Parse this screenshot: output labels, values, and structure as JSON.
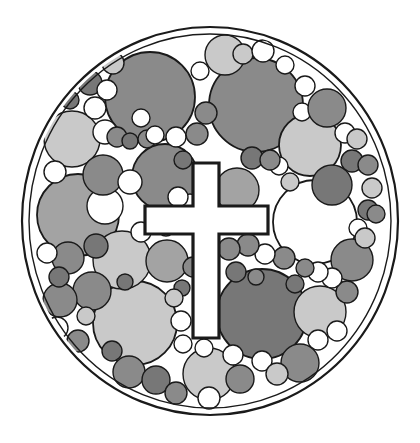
{
  "artwork": {
    "title": "Circle-packed disc emblem with Latin cross",
    "kind": "monochrome-line-art-logo",
    "canvas": {
      "width": 420,
      "height": 443,
      "background": "#ffffff"
    },
    "stroke_color": "#1a1a1a",
    "palette": {
      "white": "#ffffff",
      "light_gray": "#c9c9c9",
      "mid_gray": "#a3a3a3",
      "dark_gray": "#8a8a8a",
      "darker_gray": "#777777",
      "outline": "#1a1a1a",
      "page": "#ffffff"
    },
    "outer_disc": {
      "name": "outer-disc",
      "cx": 210,
      "cy": 221,
      "rx": 188,
      "ry": 194,
      "fill": "#ffffff",
      "stroke": "#1a1a1a",
      "stroke_width": 2.2
    },
    "inner_rim": {
      "name": "inner-rim",
      "cx": 210,
      "cy": 221,
      "rx": 181,
      "ry": 187,
      "fill": "none",
      "stroke": "#1a1a1a",
      "stroke_width": 1.4
    },
    "cross": {
      "name": "latin-cross",
      "fill": "#ffffff",
      "stroke": "#1a1a1a",
      "stroke_width": 3.2,
      "vertical_bar": {
        "x": 193,
        "y": 163,
        "width": 26,
        "height": 175
      },
      "horizontal_bar": {
        "x": 145,
        "y": 206,
        "width": 123,
        "height": 28
      },
      "path": "M193,163 L219,163 L219,206 L268,206 L268,234 L219,234 L219,338 L193,338 L193,234 L145,234 L145,206 L193,206 Z"
    },
    "circles": [
      {
        "cx": 150,
        "cy": 97,
        "r": 45,
        "fill": "#8a8a8a"
      },
      {
        "cx": 256,
        "cy": 105,
        "r": 47,
        "fill": "#8a8a8a"
      },
      {
        "cx": 165,
        "cy": 177,
        "r": 33,
        "fill": "#8a8a8a"
      },
      {
        "cx": 78,
        "cy": 215,
        "r": 41,
        "fill": "#a3a3a3"
      },
      {
        "cx": 315,
        "cy": 222,
        "r": 42,
        "fill": "#ffffff"
      },
      {
        "cx": 262,
        "cy": 314,
        "r": 45,
        "fill": "#777777"
      },
      {
        "cx": 135,
        "cy": 323,
        "r": 42,
        "fill": "#c9c9c9"
      },
      {
        "cx": 122,
        "cy": 260,
        "r": 29,
        "fill": "#c9c9c9"
      },
      {
        "cx": 310,
        "cy": 145,
        "r": 31,
        "fill": "#c9c9c9"
      },
      {
        "cx": 72,
        "cy": 139,
        "r": 28,
        "fill": "#c9c9c9"
      },
      {
        "cx": 225,
        "cy": 55,
        "r": 20,
        "fill": "#c9c9c9"
      },
      {
        "cx": 320,
        "cy": 312,
        "r": 26,
        "fill": "#c9c9c9"
      },
      {
        "cx": 209,
        "cy": 374,
        "r": 26,
        "fill": "#c9c9c9"
      },
      {
        "cx": 237,
        "cy": 190,
        "r": 22,
        "fill": "#a3a3a3"
      },
      {
        "cx": 105,
        "cy": 206,
        "r": 18,
        "fill": "#ffffff"
      },
      {
        "cx": 167,
        "cy": 261,
        "r": 21,
        "fill": "#a3a3a3"
      },
      {
        "cx": 103,
        "cy": 175,
        "r": 20,
        "fill": "#8a8a8a"
      },
      {
        "cx": 332,
        "cy": 185,
        "r": 20,
        "fill": "#777777"
      },
      {
        "cx": 352,
        "cy": 260,
        "r": 21,
        "fill": "#8a8a8a"
      },
      {
        "cx": 300,
        "cy": 363,
        "r": 19,
        "fill": "#8a8a8a"
      },
      {
        "cx": 92,
        "cy": 291,
        "r": 19,
        "fill": "#8a8a8a"
      },
      {
        "cx": 60,
        "cy": 300,
        "r": 17,
        "fill": "#8a8a8a"
      },
      {
        "cx": 68,
        "cy": 258,
        "r": 16,
        "fill": "#8a8a8a"
      },
      {
        "cx": 96,
        "cy": 246,
        "r": 12,
        "fill": "#777777"
      },
      {
        "cx": 55,
        "cy": 172,
        "r": 11,
        "fill": "#ffffff"
      },
      {
        "cx": 47,
        "cy": 253,
        "r": 10,
        "fill": "#ffffff"
      },
      {
        "cx": 59,
        "cy": 277,
        "r": 10,
        "fill": "#777777"
      },
      {
        "cx": 57,
        "cy": 328,
        "r": 11,
        "fill": "#ffffff"
      },
      {
        "cx": 78,
        "cy": 341,
        "r": 11,
        "fill": "#8a8a8a"
      },
      {
        "cx": 86,
        "cy": 316,
        "r": 9,
        "fill": "#c9c9c9"
      },
      {
        "cx": 105,
        "cy": 132,
        "r": 12,
        "fill": "#ffffff"
      },
      {
        "cx": 95,
        "cy": 108,
        "r": 11,
        "fill": "#ffffff"
      },
      {
        "cx": 90,
        "cy": 83,
        "r": 12,
        "fill": "#777777"
      },
      {
        "cx": 70,
        "cy": 100,
        "r": 9,
        "fill": "#777777"
      },
      {
        "cx": 113,
        "cy": 63,
        "r": 11,
        "fill": "#c9c9c9"
      },
      {
        "cx": 107,
        "cy": 90,
        "r": 10,
        "fill": "#ffffff"
      },
      {
        "cx": 117,
        "cy": 137,
        "r": 10,
        "fill": "#8a8a8a"
      },
      {
        "cx": 130,
        "cy": 141,
        "r": 8,
        "fill": "#777777"
      },
      {
        "cx": 147,
        "cy": 139,
        "r": 9,
        "fill": "#8a8a8a"
      },
      {
        "cx": 155,
        "cy": 135,
        "r": 9,
        "fill": "#ffffff"
      },
      {
        "cx": 176,
        "cy": 137,
        "r": 10,
        "fill": "#ffffff"
      },
      {
        "cx": 197,
        "cy": 134,
        "r": 11,
        "fill": "#8a8a8a"
      },
      {
        "cx": 206,
        "cy": 113,
        "r": 11,
        "fill": "#8a8a8a"
      },
      {
        "cx": 243,
        "cy": 54,
        "r": 10,
        "fill": "#c9c9c9"
      },
      {
        "cx": 263,
        "cy": 51,
        "r": 11,
        "fill": "#ffffff"
      },
      {
        "cx": 305,
        "cy": 86,
        "r": 10,
        "fill": "#ffffff"
      },
      {
        "cx": 302,
        "cy": 112,
        "r": 9,
        "fill": "#ffffff"
      },
      {
        "cx": 327,
        "cy": 108,
        "r": 19,
        "fill": "#8a8a8a"
      },
      {
        "cx": 345,
        "cy": 133,
        "r": 10,
        "fill": "#ffffff"
      },
      {
        "cx": 357,
        "cy": 139,
        "r": 10,
        "fill": "#c9c9c9"
      },
      {
        "cx": 352,
        "cy": 161,
        "r": 11,
        "fill": "#777777"
      },
      {
        "cx": 368,
        "cy": 165,
        "r": 10,
        "fill": "#8a8a8a"
      },
      {
        "cx": 372,
        "cy": 188,
        "r": 10,
        "fill": "#c9c9c9"
      },
      {
        "cx": 368,
        "cy": 210,
        "r": 10,
        "fill": "#777777"
      },
      {
        "cx": 376,
        "cy": 214,
        "r": 9,
        "fill": "#8a8a8a"
      },
      {
        "cx": 358,
        "cy": 228,
        "r": 9,
        "fill": "#ffffff"
      },
      {
        "cx": 365,
        "cy": 238,
        "r": 10,
        "fill": "#c9c9c9"
      },
      {
        "cx": 347,
        "cy": 292,
        "r": 11,
        "fill": "#8a8a8a"
      },
      {
        "cx": 332,
        "cy": 278,
        "r": 10,
        "fill": "#ffffff"
      },
      {
        "cx": 318,
        "cy": 272,
        "r": 10,
        "fill": "#ffffff"
      },
      {
        "cx": 305,
        "cy": 268,
        "r": 9,
        "fill": "#8a8a8a"
      },
      {
        "cx": 295,
        "cy": 284,
        "r": 9,
        "fill": "#777777"
      },
      {
        "cx": 284,
        "cy": 258,
        "r": 11,
        "fill": "#8a8a8a"
      },
      {
        "cx": 265,
        "cy": 254,
        "r": 10,
        "fill": "#ffffff"
      },
      {
        "cx": 248,
        "cy": 245,
        "r": 11,
        "fill": "#8a8a8a"
      },
      {
        "cx": 229,
        "cy": 249,
        "r": 11,
        "fill": "#8a8a8a"
      },
      {
        "cx": 236,
        "cy": 272,
        "r": 10,
        "fill": "#777777"
      },
      {
        "cx": 256,
        "cy": 277,
        "r": 8,
        "fill": "#8a8a8a"
      },
      {
        "cx": 279,
        "cy": 166,
        "r": 9,
        "fill": "#ffffff"
      },
      {
        "cx": 290,
        "cy": 182,
        "r": 9,
        "fill": "#c9c9c9"
      },
      {
        "cx": 252,
        "cy": 158,
        "r": 11,
        "fill": "#777777"
      },
      {
        "cx": 270,
        "cy": 160,
        "r": 10,
        "fill": "#8a8a8a"
      },
      {
        "cx": 183,
        "cy": 160,
        "r": 9,
        "fill": "#777777"
      },
      {
        "cx": 193,
        "cy": 267,
        "r": 10,
        "fill": "#8a8a8a"
      },
      {
        "cx": 182,
        "cy": 288,
        "r": 8,
        "fill": "#777777"
      },
      {
        "cx": 174,
        "cy": 298,
        "r": 9,
        "fill": "#c9c9c9"
      },
      {
        "cx": 181,
        "cy": 321,
        "r": 10,
        "fill": "#ffffff"
      },
      {
        "cx": 183,
        "cy": 344,
        "r": 9,
        "fill": "#ffffff"
      },
      {
        "cx": 141,
        "cy": 232,
        "r": 10,
        "fill": "#ffffff"
      },
      {
        "cx": 130,
        "cy": 182,
        "r": 12,
        "fill": "#ffffff"
      },
      {
        "cx": 190,
        "cy": 203,
        "r": 9,
        "fill": "#ffffff"
      },
      {
        "cx": 178,
        "cy": 197,
        "r": 10,
        "fill": "#ffffff"
      },
      {
        "cx": 129,
        "cy": 372,
        "r": 16,
        "fill": "#8a8a8a"
      },
      {
        "cx": 156,
        "cy": 380,
        "r": 14,
        "fill": "#777777"
      },
      {
        "cx": 176,
        "cy": 393,
        "r": 11,
        "fill": "#8a8a8a"
      },
      {
        "cx": 240,
        "cy": 379,
        "r": 14,
        "fill": "#8a8a8a"
      },
      {
        "cx": 233,
        "cy": 355,
        "r": 10,
        "fill": "#ffffff"
      },
      {
        "cx": 262,
        "cy": 361,
        "r": 10,
        "fill": "#ffffff"
      },
      {
        "cx": 277,
        "cy": 374,
        "r": 11,
        "fill": "#c9c9c9"
      },
      {
        "cx": 318,
        "cy": 340,
        "r": 10,
        "fill": "#ffffff"
      },
      {
        "cx": 337,
        "cy": 331,
        "r": 10,
        "fill": "#ffffff"
      },
      {
        "cx": 112,
        "cy": 351,
        "r": 10,
        "fill": "#777777"
      },
      {
        "cx": 204,
        "cy": 348,
        "r": 9,
        "fill": "#ffffff"
      },
      {
        "cx": 209,
        "cy": 398,
        "r": 11,
        "fill": "#ffffff"
      },
      {
        "cx": 141,
        "cy": 118,
        "r": 9,
        "fill": "#ffffff"
      },
      {
        "cx": 200,
        "cy": 71,
        "r": 9,
        "fill": "#ffffff"
      },
      {
        "cx": 285,
        "cy": 65,
        "r": 9,
        "fill": "#ffffff"
      },
      {
        "cx": 125,
        "cy": 282,
        "r": 8,
        "fill": "#777777"
      },
      {
        "cx": 166,
        "cy": 228,
        "r": 8,
        "fill": "#ffffff"
      }
    ]
  }
}
